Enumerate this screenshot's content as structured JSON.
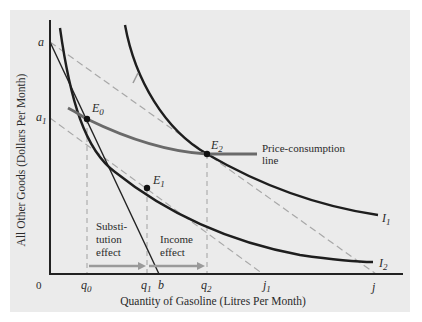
{
  "diagram": {
    "type": "indifference-curve-price-consumption",
    "colors": {
      "panel_bg": "#ebebeb",
      "axis": "#222222",
      "curve": "#1e1e1e",
      "budget_dashed": "#a8a8a8",
      "price_consumption_line": "#6a6a6a",
      "effect_arrow": "#9a9a9a",
      "text": "#2a2a2a"
    },
    "axes": {
      "x_title": "Quantity of Gasoline (Litres Per Month)",
      "y_title": "All Other Goods (Dollars Per Month)",
      "origin_label": "0"
    },
    "y_ticks": [
      {
        "base": "a",
        "sub": ""
      },
      {
        "base": "a",
        "sub": "1"
      }
    ],
    "x_ticks": [
      {
        "base": "q",
        "sub": "0"
      },
      {
        "base": "q",
        "sub": "1"
      },
      {
        "base": "b",
        "sub": ""
      },
      {
        "base": "q",
        "sub": "2"
      },
      {
        "base": "j",
        "sub": "1"
      },
      {
        "base": "j",
        "sub": ""
      }
    ],
    "points": [
      {
        "base": "E",
        "sub": "0"
      },
      {
        "base": "E",
        "sub": "1"
      },
      {
        "base": "E",
        "sub": "2"
      }
    ],
    "curves": [
      {
        "base": "I",
        "sub": "1"
      },
      {
        "base": "I",
        "sub": "2"
      }
    ],
    "annotations": {
      "price_consumption_line_1": "Price-consumption",
      "price_consumption_line_2": "line",
      "substitution_1": "Substi-",
      "substitution_2": "tution",
      "substitution_3": "effect",
      "income_1": "Income",
      "income_2": "effect"
    }
  }
}
